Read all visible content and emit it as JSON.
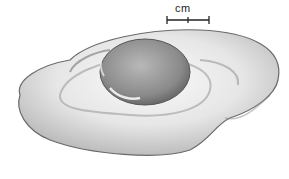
{
  "figure": {
    "scale_bar": {
      "label": "cm"
    },
    "caption_partial": "",
    "colors": {
      "background": "#ffffff",
      "white_light": "#f4f4f4",
      "white_shadow": "#9a9a9a",
      "yolk_light": "#b8b8b8",
      "yolk_dark": "#6e6e6e",
      "ink": "#222222"
    }
  }
}
